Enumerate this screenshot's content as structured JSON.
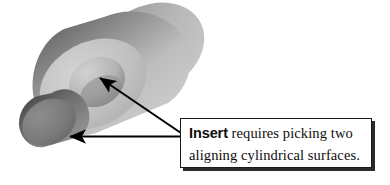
{
  "figure": {
    "type": "3d-cad-illustration",
    "title_text": "",
    "background_color": "#ffffff"
  },
  "geometry": {
    "parts": [
      {
        "name": "large-hollow-cylinder",
        "description": "large tube shown in 3/4 view with annular front face and through bore",
        "fill_light": "#d9d9d9",
        "fill_mid": "#b0b0b0",
        "fill_dark": "#6e6e6e"
      },
      {
        "name": "small-cylinder-peg",
        "description": "smaller solid cylinder positioned lower-left, darker shading",
        "fill_light": "#9a9a9a",
        "fill_mid": "#777777",
        "fill_dark": "#4a4a4a"
      },
      {
        "name": "bore-hole",
        "description": "inner cylindrical surface of the large tube",
        "fill_light": "#cfcfcf",
        "fill_dark": "#7b7b7b"
      }
    ]
  },
  "annotations": {
    "arrow_to_bore": {
      "label": "arrow-pointing-to-inner-bore-surface",
      "from_x": 181,
      "from_y": 134,
      "to_x": 98,
      "to_y": 76,
      "color": "#000000"
    },
    "arrow_to_peg": {
      "label": "arrow-pointing-to-small-cylinder-surface",
      "from_x": 181,
      "from_y": 136,
      "to_x": 68,
      "to_y": 136,
      "color": "#000000"
    }
  },
  "callout": {
    "keyword": "Insert",
    "line1_rest": " requires picking two",
    "line2": "aligning cylindrical surfaces.",
    "border_color": "#1a1a1a",
    "shadow_color": "#2b2b2b",
    "background_color": "#ffffff",
    "text_color": "#0d0d0d"
  }
}
